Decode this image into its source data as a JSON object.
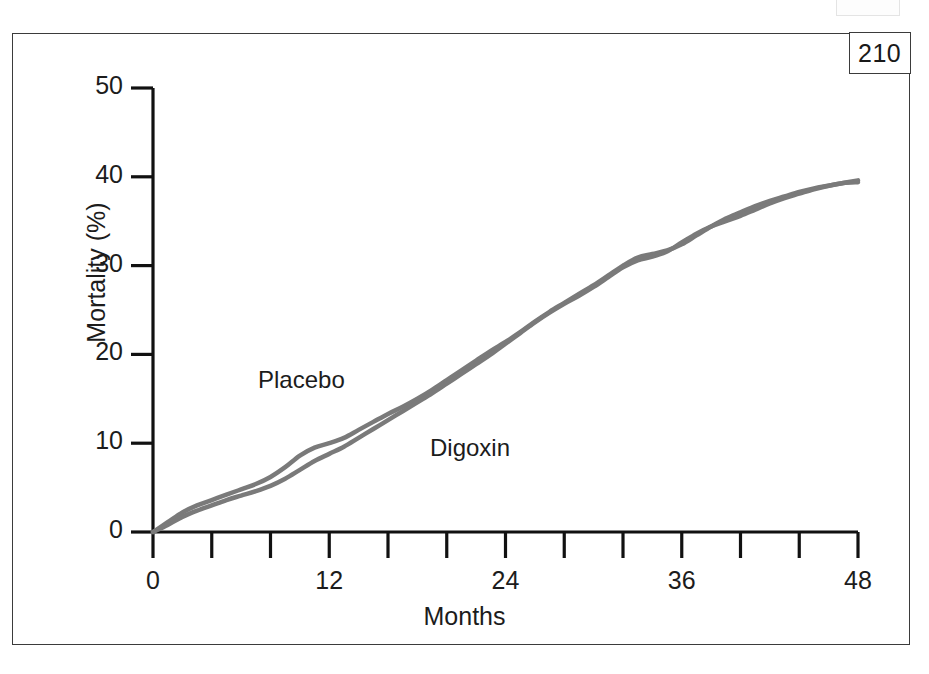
{
  "page": {
    "page_number": "210"
  },
  "chart_data": {
    "type": "line",
    "title": "",
    "xlabel": "Months",
    "ylabel": "Mortality (%)",
    "xlim": [
      0,
      48
    ],
    "ylim": [
      0,
      50
    ],
    "grid": false,
    "legend_position": "inline-annotation",
    "x_ticks": [
      0,
      4,
      8,
      12,
      16,
      20,
      24,
      28,
      32,
      36,
      40,
      44,
      48
    ],
    "x_tick_labels": [
      "0",
      "",
      "",
      "12",
      "",
      "",
      "24",
      "",
      "",
      "36",
      "",
      "",
      "48"
    ],
    "x_major_labels": [
      "0",
      "12",
      "24",
      "36",
      "48"
    ],
    "y_ticks": [
      0,
      10,
      20,
      30,
      40,
      50
    ],
    "y_tick_labels": [
      "0",
      "10",
      "20",
      "30",
      "40",
      "50"
    ],
    "line_color": "#7a7a7a",
    "line_width": 4.5,
    "x": [
      0,
      1,
      2,
      3,
      4,
      5,
      6,
      7,
      8,
      9,
      10,
      11,
      12,
      13,
      14,
      15,
      16,
      17,
      18,
      19,
      20,
      21,
      22,
      23,
      24,
      25,
      26,
      27,
      28,
      29,
      30,
      31,
      32,
      33,
      34,
      35,
      36,
      37,
      38,
      39,
      40,
      41,
      42,
      43,
      44,
      45,
      46,
      47,
      48
    ],
    "series": [
      {
        "name": "Placebo",
        "label_x": 8,
        "label_y": 18,
        "values": [
          0,
          1.1,
          2.2,
          3.0,
          3.6,
          4.2,
          4.8,
          5.4,
          6.2,
          7.3,
          8.6,
          9.5,
          10.0,
          10.6,
          11.5,
          12.4,
          13.3,
          14.1,
          15.0,
          16.0,
          17.1,
          18.2,
          19.3,
          20.4,
          21.4,
          22.5,
          23.7,
          24.8,
          25.8,
          26.8,
          27.8,
          28.9,
          30.0,
          30.9,
          31.3,
          31.7,
          32.4,
          33.4,
          34.4,
          35.3,
          36.0,
          36.7,
          37.3,
          37.8,
          38.3,
          38.7,
          39.0,
          39.3,
          39.6
        ]
      },
      {
        "name": "Digoxin",
        "label_x": 19,
        "label_y": 11,
        "values": [
          0,
          0.8,
          1.7,
          2.4,
          3.0,
          3.6,
          4.1,
          4.6,
          5.2,
          6.0,
          7.0,
          8.0,
          8.8,
          9.6,
          10.6,
          11.6,
          12.6,
          13.6,
          14.6,
          15.6,
          16.7,
          17.8,
          18.9,
          20.0,
          21.2,
          22.4,
          23.6,
          24.7,
          25.7,
          26.6,
          27.6,
          28.7,
          29.8,
          30.6,
          31.0,
          31.6,
          32.6,
          33.6,
          34.4,
          35.0,
          35.6,
          36.3,
          37.0,
          37.6,
          38.1,
          38.6,
          39.0,
          39.3,
          39.4
        ]
      }
    ]
  }
}
